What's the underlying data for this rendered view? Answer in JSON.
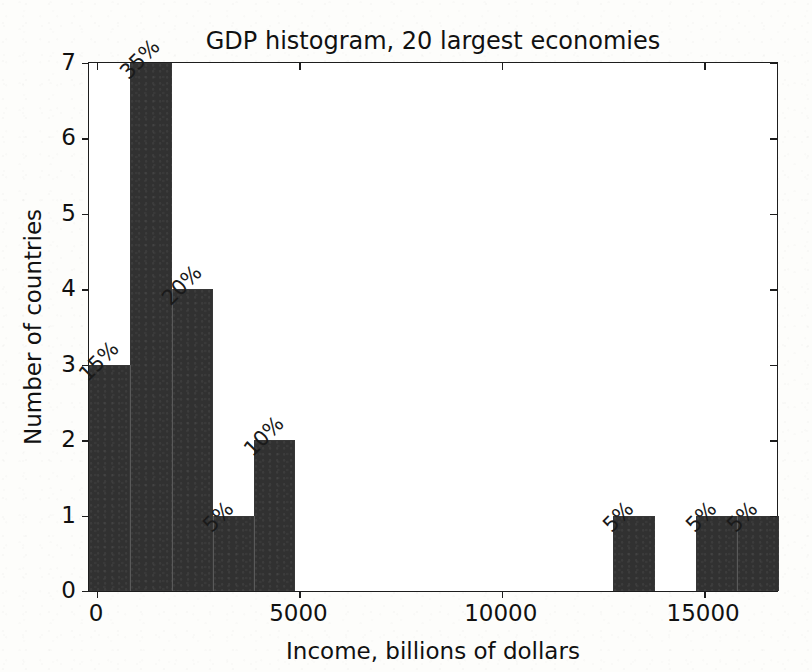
{
  "chart_data": {
    "type": "bar",
    "title": "GDP histogram, 20 largest economies",
    "xlabel": "Income, billions of dollars",
    "ylabel": "Number of countries",
    "xlim": [
      -200,
      16800
    ],
    "ylim": [
      0,
      7
    ],
    "grid": false,
    "legend": null,
    "bin_width": 1020,
    "x_ticks": [
      0,
      5000,
      10000,
      15000
    ],
    "x_tick_labels": [
      "0",
      "5000",
      "10000",
      "15000"
    ],
    "y_ticks": [
      0,
      1,
      2,
      3,
      4,
      5,
      6,
      7
    ],
    "y_tick_labels": [
      "0",
      "1",
      "2",
      "3",
      "4",
      "5",
      "6",
      "7"
    ],
    "bar_color": "#313131",
    "bins": [
      {
        "x_left": -200,
        "x_right": 820,
        "count": 3,
        "percent_label": "15%"
      },
      {
        "x_left": 820,
        "x_right": 1840,
        "count": 7,
        "percent_label": "35%"
      },
      {
        "x_left": 1840,
        "x_right": 2860,
        "count": 4,
        "percent_label": "20%"
      },
      {
        "x_left": 2860,
        "x_right": 3880,
        "count": 1,
        "percent_label": "5%"
      },
      {
        "x_left": 3880,
        "x_right": 4900,
        "count": 2,
        "percent_label": "10%"
      },
      {
        "x_left": 12760,
        "x_right": 13780,
        "count": 1,
        "percent_label": "5%"
      },
      {
        "x_left": 14800,
        "x_right": 15820,
        "count": 1,
        "percent_label": "5%"
      },
      {
        "x_left": 15820,
        "x_right": 16840,
        "count": 1,
        "percent_label": "5%"
      }
    ],
    "categories": [
      "0-820",
      "820-1840",
      "1840-2860",
      "2860-3880",
      "3880-4900",
      "12760-13780",
      "14800-15820",
      "15820-16840"
    ],
    "values": [
      3,
      7,
      4,
      1,
      2,
      1,
      1,
      1
    ],
    "data_labels": [
      "15%",
      "35%",
      "20%",
      "5%",
      "10%",
      "5%",
      "5%",
      "5%"
    ]
  },
  "page": {
    "bleed_through_text": "reverse-side printing faintly visible through the paper"
  }
}
